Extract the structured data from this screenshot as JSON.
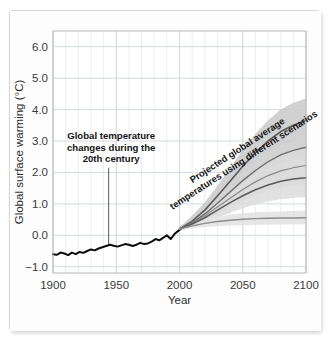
{
  "chart_data": {
    "type": "line",
    "title": "",
    "xlabel": "Year",
    "ylabel": "Global surface warming (°C)",
    "xlim": [
      1900,
      2100
    ],
    "ylim": [
      -1.2,
      6.5
    ],
    "grid": true,
    "legend_position": "none",
    "xticks": [
      "1900",
      "1950",
      "2000",
      "2050",
      "2100"
    ],
    "xtick_values": [
      1900,
      1950,
      2000,
      2050,
      2100
    ],
    "yticks": [
      "6.0",
      "5.0",
      "4.0",
      "3.0",
      "2.0",
      "1.0",
      "0.0",
      "−1.0"
    ],
    "ytick_values": [
      6.0,
      5.0,
      4.0,
      3.0,
      2.0,
      1.0,
      0.0,
      -1.0
    ],
    "minor_gridline_interval_x": 10,
    "annotations": [
      {
        "name": "historical-annotation",
        "text_lines": [
          "Global temperature",
          "changes during the",
          "20th century"
        ],
        "rotation": 0,
        "pointer": true,
        "pointer_from_year": 1944,
        "pointer_to_value": -0.28
      },
      {
        "name": "projection-annotation",
        "text_lines": [
          "Projected global average",
          "temperatures using different scenarios"
        ],
        "rotation": -33,
        "pointer": false
      }
    ],
    "series": [
      {
        "name": "observed",
        "style": "solid",
        "color": "#0d0d0d",
        "width": 2.0,
        "x": [
          1900,
          1903,
          1906,
          1909,
          1912,
          1915,
          1918,
          1921,
          1924,
          1927,
          1930,
          1933,
          1936,
          1939,
          1942,
          1945,
          1948,
          1951,
          1954,
          1957,
          1960,
          1963,
          1966,
          1969,
          1972,
          1975,
          1978,
          1981,
          1984,
          1987,
          1990,
          1993,
          1996,
          1999,
          2001
        ],
        "y": [
          -0.6,
          -0.62,
          -0.55,
          -0.58,
          -0.63,
          -0.55,
          -0.6,
          -0.53,
          -0.56,
          -0.5,
          -0.45,
          -0.48,
          -0.42,
          -0.38,
          -0.34,
          -0.3,
          -0.33,
          -0.36,
          -0.32,
          -0.28,
          -0.3,
          -0.34,
          -0.3,
          -0.24,
          -0.28,
          -0.26,
          -0.2,
          -0.12,
          -0.16,
          -0.08,
          0.0,
          -0.12,
          0.04,
          0.14,
          0.2
        ]
      },
      {
        "name": "scenario-high",
        "style": "solid",
        "color": "#595959",
        "width": 1.6,
        "x": [
          2000,
          2010,
          2020,
          2030,
          2040,
          2050,
          2060,
          2070,
          2080,
          2090,
          2100
        ],
        "y": [
          0.2,
          0.45,
          0.8,
          1.25,
          1.72,
          2.2,
          2.62,
          3.0,
          3.3,
          3.5,
          3.65
        ]
      },
      {
        "name": "scenario-mid-high",
        "style": "solid",
        "color": "#6e6e6e",
        "width": 1.4,
        "x": [
          2000,
          2010,
          2020,
          2030,
          2040,
          2050,
          2060,
          2070,
          2080,
          2090,
          2100
        ],
        "y": [
          0.2,
          0.4,
          0.68,
          1.02,
          1.38,
          1.74,
          2.06,
          2.34,
          2.56,
          2.7,
          2.8
        ]
      },
      {
        "name": "scenario-mid",
        "style": "solid",
        "color": "#8a8a8a",
        "width": 1.2,
        "x": [
          2000,
          2010,
          2020,
          2030,
          2040,
          2050,
          2060,
          2070,
          2080,
          2090,
          2100
        ],
        "y": [
          0.2,
          0.38,
          0.62,
          0.9,
          1.18,
          1.46,
          1.7,
          1.9,
          2.05,
          2.15,
          2.22
        ]
      },
      {
        "name": "scenario-low",
        "style": "solid",
        "color": "#5c5c5c",
        "width": 1.6,
        "x": [
          2000,
          2010,
          2020,
          2030,
          2040,
          2050,
          2060,
          2070,
          2080,
          2090,
          2100
        ],
        "y": [
          0.2,
          0.36,
          0.56,
          0.8,
          1.04,
          1.26,
          1.45,
          1.6,
          1.72,
          1.79,
          1.83
        ]
      },
      {
        "name": "constant-composition",
        "style": "solid",
        "color": "#8c8c8c",
        "width": 1.4,
        "x": [
          2000,
          2010,
          2020,
          2030,
          2040,
          2050,
          2060,
          2070,
          2080,
          2090,
          2100
        ],
        "y": [
          0.2,
          0.3,
          0.38,
          0.44,
          0.48,
          0.51,
          0.53,
          0.54,
          0.55,
          0.55,
          0.56
        ]
      }
    ],
    "bands": [
      {
        "name": "uncertainty-band-high",
        "color": "#c9c9c9",
        "x": [
          2000,
          2010,
          2020,
          2030,
          2040,
          2050,
          2060,
          2070,
          2080,
          2090,
          2100
        ],
        "upper": [
          0.26,
          0.62,
          1.05,
          1.58,
          2.14,
          2.72,
          3.22,
          3.66,
          4.0,
          4.22,
          4.35
        ],
        "lower": [
          0.16,
          0.32,
          0.58,
          0.92,
          1.3,
          1.68,
          2.02,
          2.32,
          2.56,
          2.72,
          2.82
        ]
      },
      {
        "name": "uncertainty-band-mid",
        "color": "#d4d4d4",
        "x": [
          2000,
          2010,
          2020,
          2030,
          2040,
          2050,
          2060,
          2070,
          2080,
          2090,
          2100
        ],
        "upper": [
          0.24,
          0.5,
          0.84,
          1.24,
          1.64,
          2.02,
          2.36,
          2.64,
          2.86,
          3.0,
          3.1
        ],
        "lower": [
          0.16,
          0.28,
          0.46,
          0.68,
          0.9,
          1.1,
          1.28,
          1.42,
          1.52,
          1.58,
          1.62
        ]
      },
      {
        "name": "uncertainty-band-low",
        "color": "#dcdcdc",
        "x": [
          2000,
          2010,
          2020,
          2030,
          2040,
          2050,
          2060,
          2070,
          2080,
          2090,
          2100
        ],
        "upper": [
          0.23,
          0.46,
          0.74,
          1.06,
          1.38,
          1.68,
          1.94,
          2.14,
          2.3,
          2.4,
          2.46
        ],
        "lower": [
          0.16,
          0.26,
          0.4,
          0.56,
          0.72,
          0.86,
          0.98,
          1.08,
          1.15,
          1.19,
          1.22
        ]
      },
      {
        "name": "uncertainty-band-constant",
        "color": "#e2e2e2",
        "x": [
          2000,
          2010,
          2020,
          2030,
          2040,
          2050,
          2060,
          2070,
          2080,
          2090,
          2100
        ],
        "upper": [
          0.22,
          0.38,
          0.5,
          0.6,
          0.66,
          0.7,
          0.73,
          0.75,
          0.76,
          0.77,
          0.78
        ],
        "lower": [
          0.16,
          0.22,
          0.26,
          0.29,
          0.31,
          0.32,
          0.33,
          0.34,
          0.34,
          0.34,
          0.35
        ]
      }
    ],
    "colors": {
      "grid_major": "#cfd6dd",
      "grid_minor": "#e6eaee",
      "plot_border": "#b9b9b9",
      "observed_line": "#0d0d0d",
      "text": "#2d2d2d"
    }
  }
}
